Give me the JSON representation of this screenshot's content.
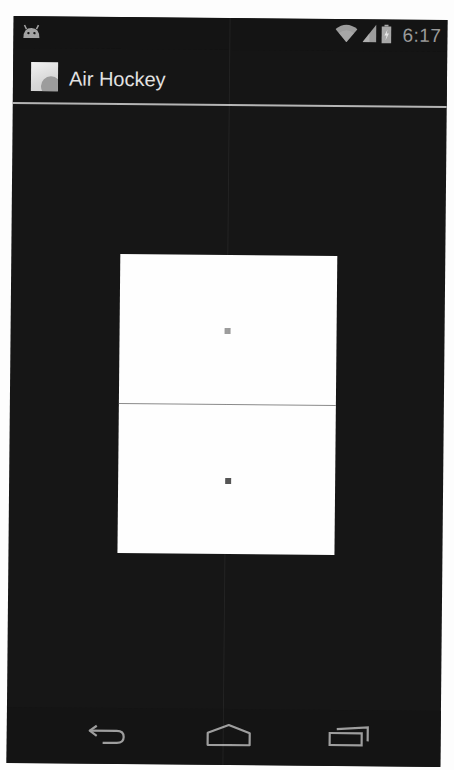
{
  "status_bar": {
    "notification_icon": "android-icon",
    "icons": [
      "wifi-icon",
      "cell-signal-icon",
      "battery-charging-icon"
    ],
    "time": "6:17"
  },
  "action_bar": {
    "app_icon": "app-launcher-icon",
    "title": "Air Hockey"
  },
  "game": {
    "table_color": "#fefefe",
    "background_color": "#161616",
    "center_line_color": "#8a8a8a",
    "mallets": [
      {
        "name": "top-mallet",
        "color": "#9b9b9b"
      },
      {
        "name": "bottom-mallet",
        "color": "#555555"
      }
    ]
  },
  "nav_bar": {
    "buttons": [
      {
        "name": "back",
        "icon": "back-arrow-icon"
      },
      {
        "name": "home",
        "icon": "home-icon"
      },
      {
        "name": "recents",
        "icon": "recent-apps-icon"
      }
    ]
  }
}
